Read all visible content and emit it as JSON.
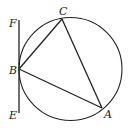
{
  "diagram": {
    "type": "geometry",
    "circle": {
      "cx": 70.5,
      "cy": 69,
      "r": 51.5
    },
    "points": {
      "A": {
        "x": 102,
        "y": 108,
        "label": "A"
      },
      "B": {
        "x": 19,
        "y": 69,
        "label": "B"
      },
      "C": {
        "x": 62,
        "y": 19,
        "label": "C"
      },
      "E": {
        "x": 19,
        "y": 113,
        "label": "E"
      },
      "F": {
        "x": 19,
        "y": 20,
        "label": "F"
      }
    },
    "segments": [
      [
        "A",
        "B"
      ],
      [
        "B",
        "C"
      ],
      [
        "C",
        "A"
      ],
      [
        "E",
        "F"
      ]
    ],
    "stroke_color": "#222222"
  }
}
